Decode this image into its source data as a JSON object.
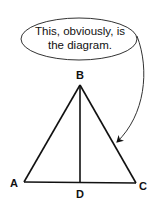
{
  "callout": {
    "line1": "This, obviously, is",
    "line2": "the diagram."
  },
  "points": {
    "A": "A",
    "B": "B",
    "C": "C",
    "D": "D"
  },
  "colors": {
    "stroke": "#111111",
    "background": "#ffffff"
  }
}
